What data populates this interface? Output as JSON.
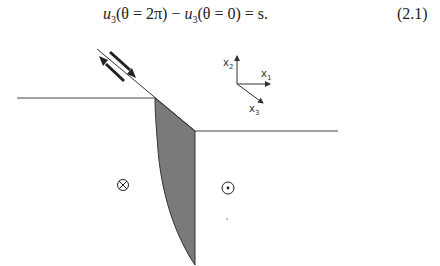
{
  "equation": {
    "lhs_a": "u",
    "lhs_a_sub": "3",
    "arg_a": "(θ = 2π)",
    "minus": " − ",
    "lhs_b": "u",
    "lhs_b_sub": "3",
    "arg_b": "(θ = 0)",
    "rhs": " = s.",
    "number": "(2.1)"
  },
  "axes": {
    "x1": {
      "label": "x",
      "sub": "1"
    },
    "x2": {
      "label": "x",
      "sub": "2"
    },
    "x3": {
      "label": "x",
      "sub": "3"
    }
  },
  "symbols": {
    "into_page": "⊗",
    "out_of_page": "⊙"
  },
  "colors": {
    "line": "#333333",
    "fill": "#7a7a7a",
    "background": "#ffffff"
  }
}
